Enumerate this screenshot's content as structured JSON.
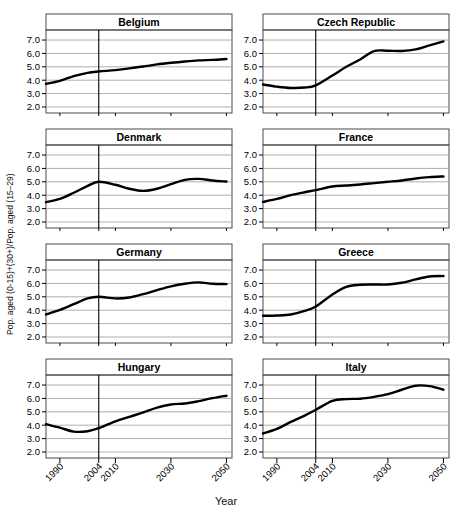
{
  "figure": {
    "xlabel": "Year",
    "ylabel": "Pop. aged (0-15)+(30+)/Pop. aged (15–29)"
  },
  "chart_data": {
    "type": "line",
    "title": "",
    "xlabel": "Year",
    "ylabel": "Pop. aged (0-15)+(30+)/Pop. aged (15-29)",
    "xlim": [
      1985,
      2052
    ],
    "ylim": [
      1.55,
      7.75
    ],
    "yticks": [
      2.0,
      3.0,
      4.0,
      5.0,
      6.0,
      7.0
    ],
    "ytick_labels": [
      "2.0",
      "3.0",
      "4.0",
      "5.0",
      "6.0",
      "7.0"
    ],
    "xticks": [
      1990,
      2004,
      2010,
      2030,
      2050
    ],
    "xtick_labels": [
      "1990",
      "2004",
      "2010",
      "2030",
      "2050"
    ],
    "grid": true,
    "grid_axis": "y",
    "legend": "none",
    "reference_line_x": 2004,
    "layout": {
      "rows": 4,
      "cols": 2
    },
    "x": [
      1985,
      1990,
      1995,
      2000,
      2004,
      2010,
      2015,
      2020,
      2025,
      2030,
      2035,
      2040,
      2045,
      2050
    ],
    "panels": [
      {
        "name": "Belgium",
        "values": [
          3.72,
          3.95,
          4.3,
          4.55,
          4.65,
          4.75,
          4.88,
          5.02,
          5.18,
          5.3,
          5.4,
          5.48,
          5.52,
          5.58
        ]
      },
      {
        "name": "Czech Republic",
        "values": [
          3.68,
          3.52,
          3.42,
          3.45,
          3.62,
          4.35,
          5.0,
          5.55,
          6.18,
          6.2,
          6.18,
          6.3,
          6.6,
          6.9
        ]
      },
      {
        "name": "Denmark",
        "values": [
          3.48,
          3.72,
          4.18,
          4.7,
          5.0,
          4.78,
          4.48,
          4.32,
          4.48,
          4.82,
          5.15,
          5.22,
          5.1,
          5.02
        ]
      },
      {
        "name": "France",
        "values": [
          3.5,
          3.72,
          4.0,
          4.22,
          4.38,
          4.65,
          4.72,
          4.8,
          4.9,
          5.0,
          5.1,
          5.25,
          5.35,
          5.4
        ]
      },
      {
        "name": "Germany",
        "values": [
          3.68,
          4.02,
          4.45,
          4.88,
          5.0,
          4.88,
          4.95,
          5.2,
          5.5,
          5.78,
          5.98,
          6.08,
          5.98,
          5.95
        ]
      },
      {
        "name": "Greece",
        "values": [
          3.58,
          3.6,
          3.68,
          3.95,
          4.28,
          5.18,
          5.75,
          5.9,
          5.92,
          5.92,
          6.05,
          6.3,
          6.52,
          6.55
        ]
      },
      {
        "name": "Hungary",
        "values": [
          4.08,
          3.82,
          3.52,
          3.55,
          3.78,
          4.28,
          4.62,
          4.95,
          5.32,
          5.55,
          5.62,
          5.8,
          6.02,
          6.2
        ]
      },
      {
        "name": "Italy",
        "values": [
          3.38,
          3.72,
          4.25,
          4.72,
          5.15,
          5.82,
          5.95,
          5.98,
          6.12,
          6.32,
          6.65,
          6.95,
          6.92,
          6.65
        ]
      }
    ]
  }
}
